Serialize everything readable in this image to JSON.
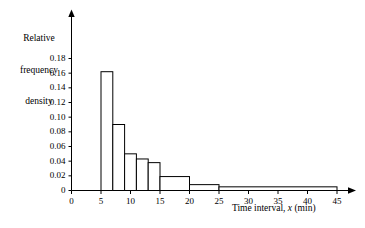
{
  "chart_data": {
    "type": "bar",
    "title": "",
    "subtitle": "",
    "xlabel_parts": {
      "pre": "Time interval, ",
      "italic": "x",
      "post": " (min)"
    },
    "xlabel": "Time interval, x (min)",
    "ylabel": "Relative frequency density",
    "ylabel_lines": [
      "Relative",
      "frequency",
      "density"
    ],
    "xlim": [
      0,
      45
    ],
    "ylim": [
      0,
      0.18
    ],
    "grid": false,
    "legend": "none",
    "bar_style": "unfilled-outline-histogram",
    "xticks": [
      0,
      5,
      10,
      15,
      20,
      25,
      30,
      35,
      40,
      45
    ],
    "xtick_labels": [
      "0",
      "5",
      "10",
      "15",
      "20",
      "25",
      "30",
      "35",
      "40",
      "45"
    ],
    "yticks": [
      0,
      0.02,
      0.04,
      0.06,
      0.08,
      0.1,
      0.12,
      0.14,
      0.16,
      0.18
    ],
    "ytick_labels": [
      "0",
      "0.02",
      "0.04",
      "0.06",
      "0.08",
      "0.10",
      "0.12",
      "0.14",
      "0.16",
      "0.18"
    ],
    "bins": [
      {
        "x0": 5,
        "x1": 7,
        "value": 0.162,
        "label": "5-7"
      },
      {
        "x0": 7,
        "x1": 9,
        "value": 0.09,
        "label": "7-9"
      },
      {
        "x0": 9,
        "x1": 11,
        "value": 0.05,
        "label": "9-11"
      },
      {
        "x0": 11,
        "x1": 13,
        "value": 0.043,
        "label": "11-13"
      },
      {
        "x0": 13,
        "x1": 15,
        "value": 0.038,
        "label": "13-15"
      },
      {
        "x0": 15,
        "x1": 20,
        "value": 0.019,
        "label": "15-20"
      },
      {
        "x0": 20,
        "x1": 25,
        "value": 0.008,
        "label": "20-25"
      },
      {
        "x0": 25,
        "x1": 45,
        "value": 0.005,
        "label": "25-45"
      }
    ],
    "categories": [
      "5-7",
      "7-9",
      "9-11",
      "11-13",
      "13-15",
      "15-20",
      "20-25",
      "25-45"
    ],
    "values": [
      0.162,
      0.09,
      0.05,
      0.043,
      0.038,
      0.019,
      0.008,
      0.005
    ],
    "colors": {
      "line": "#000000",
      "fill": "#ffffff",
      "background": "#ffffff"
    }
  }
}
